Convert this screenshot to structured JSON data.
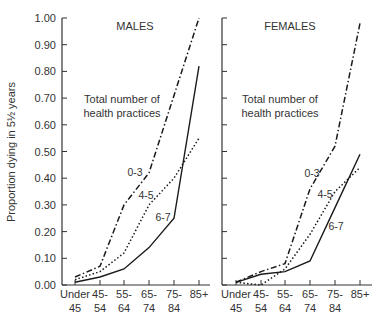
{
  "chart_data": [
    {
      "type": "line",
      "title": "MALES",
      "annotation": "Total number of health practices",
      "xlabel": "",
      "ylabel": "Proportion dying in 5½ years",
      "ylim": [
        0,
        1.0
      ],
      "yticks": [
        "0.00",
        "0.10",
        "0.20",
        "0.30",
        "0.40",
        "0.50",
        "0.60",
        "0.70",
        "0.80",
        "0.90",
        "1.00"
      ],
      "categories": [
        "Under 45",
        "45-54",
        "55-64",
        "65-74",
        "75-84",
        "85+"
      ],
      "category_lines": [
        [
          "Under",
          "45"
        ],
        [
          "45-",
          "54"
        ],
        [
          "55-",
          "64"
        ],
        [
          "65-",
          "74"
        ],
        [
          "75-",
          "84"
        ],
        [
          "85+",
          ""
        ]
      ],
      "grid": false,
      "series": [
        {
          "name": "0-3",
          "style": "dashdot",
          "values": [
            0.03,
            0.07,
            0.3,
            0.42,
            0.71,
            1.0
          ]
        },
        {
          "name": "4-5",
          "style": "dotted",
          "values": [
            0.02,
            0.05,
            0.12,
            0.3,
            0.4,
            0.55
          ]
        },
        {
          "name": "6-7",
          "style": "solid",
          "values": [
            0.01,
            0.03,
            0.06,
            0.14,
            0.25,
            0.82
          ]
        }
      ]
    },
    {
      "type": "line",
      "title": "FEMALES",
      "annotation": "Total number of health practices",
      "xlabel": "",
      "ylabel": "",
      "ylim": [
        0,
        1.0
      ],
      "categories": [
        "Under 45",
        "45-54",
        "55-64",
        "65-74",
        "75-84",
        "85+"
      ],
      "category_lines": [
        [
          "Under",
          "45"
        ],
        [
          "45-",
          "54"
        ],
        [
          "55-",
          "64"
        ],
        [
          "65-",
          "74"
        ],
        [
          "75-",
          "84"
        ],
        [
          "85+",
          ""
        ]
      ],
      "grid": false,
      "series": [
        {
          "name": "0-3",
          "style": "dashdot",
          "values": [
            0.01,
            0.05,
            0.08,
            0.36,
            0.52,
            0.98
          ]
        },
        {
          "name": "4-5",
          "style": "dotted",
          "values": [
            0.01,
            0.0,
            0.06,
            0.19,
            0.35,
            0.44
          ]
        },
        {
          "name": "6-7",
          "style": "solid",
          "values": [
            0.01,
            0.04,
            0.05,
            0.09,
            0.29,
            0.49
          ]
        }
      ]
    }
  ],
  "labels": {
    "males_title": "MALES",
    "females_title": "FEMALES",
    "annotation_line1": "Total number of",
    "annotation_line2": "health practices",
    "y_axis_label": "Proportion dying in 5½ years",
    "series_labels": [
      "0-3",
      "4-5",
      "6-7"
    ]
  },
  "colors": {
    "line": "#1a1a1a",
    "axis": "#333333",
    "text": "#333333"
  }
}
